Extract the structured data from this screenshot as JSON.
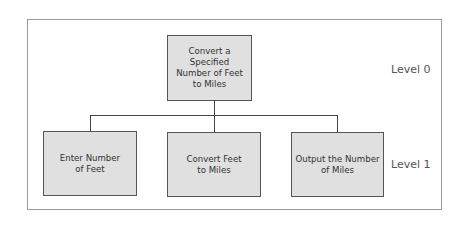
{
  "diagram": {
    "root": {
      "label": "Convert a Specified Number of Feet to Miles"
    },
    "children": [
      {
        "label": "Enter Number of Feet"
      },
      {
        "label": "Convert Feet to Miles"
      },
      {
        "label": "Output the Number of Miles"
      }
    ],
    "levels": [
      {
        "label": "Level 0"
      },
      {
        "label": "Level 1"
      }
    ],
    "colors": {
      "box_fill": "#e0e0e0",
      "box_border": "#555555",
      "connector": "#444444",
      "frame_border": "#9a9a9a"
    }
  }
}
